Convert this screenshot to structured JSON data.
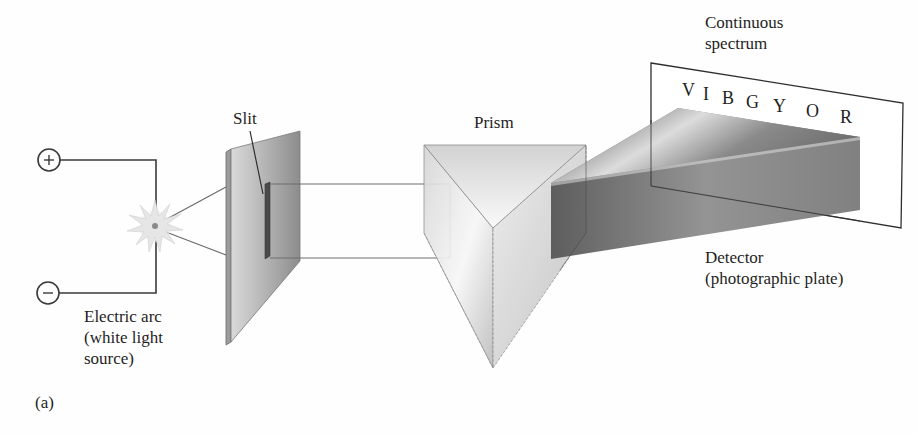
{
  "figure": {
    "panel_label": "(a)",
    "labels": {
      "slit": "Slit",
      "prism": "Prism",
      "continuous_spectrum_line1": "Continuous",
      "continuous_spectrum_line2": "spectrum",
      "detector_line1": "Detector",
      "detector_line2": "(photographic plate)",
      "electric_arc_line1": "Electric arc",
      "electric_arc_line2": "(white light",
      "electric_arc_line3": "source)"
    },
    "terminals": {
      "positive": "+",
      "negative": "−"
    },
    "spectrum_letters": [
      "V",
      "I",
      "B",
      "G",
      "Y",
      "O",
      "R"
    ],
    "colors": {
      "line": "#3a3a3a",
      "text": "#1e1e1e",
      "plate_light": "#d8d8d8",
      "plate_dark": "#8a8a8a",
      "prism_light": "#f2f2f2",
      "prism_mid": "#c8c8c8",
      "fan_dark": "#4a4a4a",
      "fan_light": "#d0d0d0"
    }
  }
}
